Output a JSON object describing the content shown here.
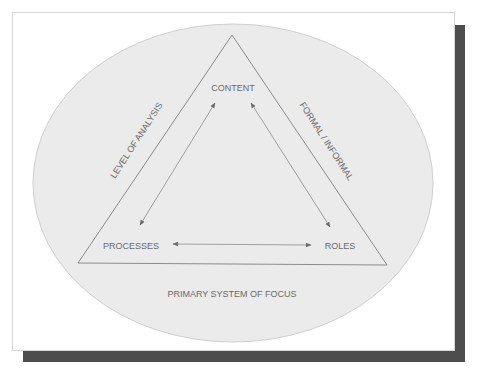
{
  "diagram": {
    "type": "triangle-in-ellipse",
    "colors": {
      "ellipse_fill": "#ebebeb",
      "ellipse_stroke": "#cfcfcf",
      "triangle_stroke": "#8c8c8c",
      "arrow": "#6a6a6a",
      "text": "#6a6a6a",
      "shadow": "#4d4d4d"
    },
    "nodes": {
      "top": "CONTENT",
      "bottom_left": "PROCESSES",
      "bottom_right": "ROLES"
    },
    "edge_labels": {
      "left_side": "LEVEL OF ANALYSIS",
      "right_side": "FORMAL / INFORMAL",
      "bottom_outside": "PRIMARY SYSTEM OF FOCUS"
    },
    "arrows": [
      {
        "from": "CONTENT",
        "to": "PROCESSES",
        "bidirectional": true
      },
      {
        "from": "CONTENT",
        "to": "ROLES",
        "bidirectional": true
      },
      {
        "from": "PROCESSES",
        "to": "ROLES",
        "bidirectional": true
      }
    ]
  }
}
